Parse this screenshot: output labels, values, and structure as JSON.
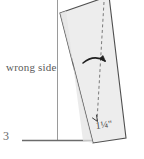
{
  "diagram": {
    "step_number": "3",
    "fabric_label": "wrong side",
    "measurement_label": "1¼\"",
    "colors": {
      "fabric_fill": "#eeeeee",
      "fabric_outline": "#555555",
      "guide_line": "#8a8a8a",
      "dashed_fold_line": "#777777",
      "arrow": "#222222",
      "text": "#4a4a4a",
      "background": "#ffffff"
    },
    "elements": {
      "vertical_guide_name": "vertical-guide-line",
      "horizontal_guide_name": "horizontal-guide-line",
      "fabric_name": "fabric-piece",
      "fold_line_name": "dashed-fold-line",
      "rotation_arrow_name": "rotation-arrow",
      "measurement_tick_name": "measurement-tick"
    },
    "geometry": {
      "fabric_points": "60,13 109,-3 126,138 93,143",
      "vertical_guide": {
        "x": 57,
        "y1": 0,
        "y2": 141
      },
      "horizontal_guide": {
        "x1": 22,
        "x2": 101,
        "y": 140
      },
      "fold_line": {
        "x1": 104,
        "y1": 2,
        "x2": 97,
        "y2": 122
      }
    }
  }
}
